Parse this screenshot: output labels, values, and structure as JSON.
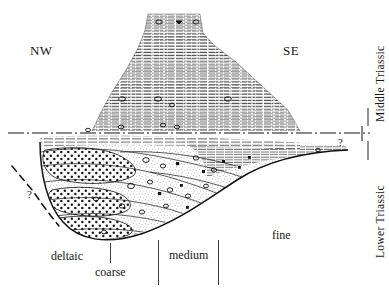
{
  "figure": {
    "type": "geological-cross-section",
    "title": "",
    "orientation": {
      "left_label": "NW",
      "right_label": "SE"
    },
    "stratigraphic_divisions": {
      "upper_label": "Middle Triassic",
      "lower_label": "Lower Triassic",
      "boundary_style": "dash-dot horizontal line",
      "boundary_y": 133
    },
    "grain_size_labels": [
      {
        "label": "deltaic",
        "x": 51,
        "y": 249
      },
      {
        "label": "coarse",
        "x": 95,
        "y": 265
      },
      {
        "label": "medium",
        "x": 169,
        "y": 248
      },
      {
        "label": "fine",
        "x": 272,
        "y": 228
      }
    ],
    "uncertainty_marks": [
      {
        "symbol": "?",
        "x": 27,
        "y": 188,
        "note": "left dashed basal extrapolation"
      },
      {
        "symbol": "?",
        "x": 338,
        "y": 136,
        "note": "right distal pinch-out"
      }
    ],
    "units": [
      {
        "name": "upper-stratified-unit",
        "pattern": "dense horizontal bedding lines (limestone / marl)",
        "description": "narrow column at top widening downward into a broad mound terminating at the Lower/Middle Triassic boundary",
        "grain": "fine"
      },
      {
        "name": "conglomerate-lenses",
        "pattern": "coarse dotted / pebbly stipple",
        "description": "stacked dotted lens bodies on the NW (left) margin",
        "grain": "coarse"
      },
      {
        "name": "sandstone-body",
        "pattern": "fine stipple with scattered clasts",
        "description": "medium-grained wedge thinning toward the SE",
        "grain": "medium"
      },
      {
        "name": "distal-laminated-wedge",
        "pattern": "thin parallel laminae",
        "description": "SE tapering pinch-out with queried termination",
        "grain": "fine"
      }
    ],
    "axis_ticks": [
      {
        "name": "tick-coarse",
        "x": 110
      },
      {
        "name": "tick-medium-left",
        "x": 158
      },
      {
        "name": "tick-medium-right",
        "x": 218
      }
    ]
  }
}
